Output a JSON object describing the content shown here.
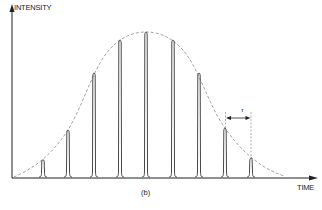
{
  "diagram": {
    "y_axis_label": "INTENSITY",
    "x_axis_label": "TIME",
    "caption": "(b)",
    "period_label": "τ",
    "colors": {
      "axis": "#222222",
      "pulse": "#333333",
      "envelope": "#999999",
      "background": "#ffffff"
    },
    "envelope": {
      "shape": "gaussian",
      "style": "dashed",
      "center_x": 146,
      "peak_y": 32,
      "baseline_y": 177
    },
    "pulses": [
      {
        "x": 43,
        "peak_y": 160
      },
      {
        "x": 68,
        "peak_y": 130
      },
      {
        "x": 94,
        "peak_y": 73
      },
      {
        "x": 120,
        "peak_y": 40
      },
      {
        "x": 146,
        "peak_y": 32
      },
      {
        "x": 173,
        "peak_y": 40
      },
      {
        "x": 199,
        "peak_y": 73
      },
      {
        "x": 225,
        "peak_y": 128
      },
      {
        "x": 251,
        "peak_y": 158
      }
    ],
    "period_marker": {
      "x_start": 225,
      "x_end": 251,
      "y": 118
    }
  }
}
